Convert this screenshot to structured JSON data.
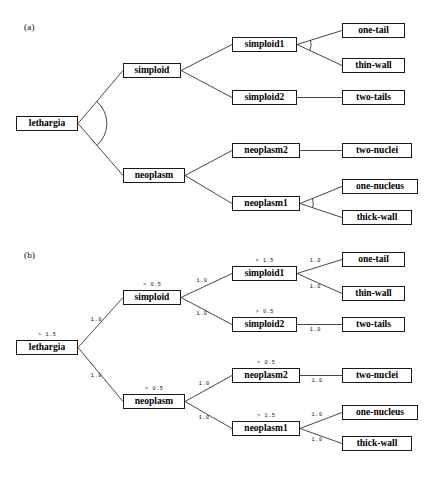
{
  "figure": {
    "panels": [
      {
        "id": "a",
        "label": "(a)",
        "shows_weights": false,
        "nodes": [
          {
            "key": "lethargia",
            "label": "lethargia",
            "x": 16,
            "y": 116,
            "w": 62,
            "type": "internal"
          },
          {
            "key": "simploid",
            "label": "simploid",
            "x": 123,
            "y": 63,
            "w": 58,
            "type": "internal"
          },
          {
            "key": "neoplasm",
            "label": "neoplasm",
            "x": 123,
            "y": 168,
            "w": 62,
            "type": "internal"
          },
          {
            "key": "simploid1",
            "label": "simploid1",
            "x": 232,
            "y": 37,
            "w": 65,
            "type": "internal"
          },
          {
            "key": "simploid2",
            "label": "simploid2",
            "x": 232,
            "y": 90,
            "w": 65,
            "type": "internal"
          },
          {
            "key": "neoplasm2",
            "label": "neoplasm2",
            "x": 232,
            "y": 143,
            "w": 68,
            "type": "internal"
          },
          {
            "key": "neoplasm1",
            "label": "neoplasm1",
            "x": 232,
            "y": 196,
            "w": 68,
            "type": "internal"
          },
          {
            "key": "one-tail",
            "label": "one-tail",
            "x": 342,
            "y": 23,
            "w": 63,
            "type": "leaf"
          },
          {
            "key": "thin-wall",
            "label": "thin-wall",
            "x": 342,
            "y": 58,
            "w": 63,
            "type": "leaf"
          },
          {
            "key": "two-tails",
            "label": "two-tails",
            "x": 342,
            "y": 90,
            "w": 63,
            "type": "leaf"
          },
          {
            "key": "two-nuclei",
            "label": "two-nuclei",
            "x": 342,
            "y": 143,
            "w": 70,
            "type": "leaf"
          },
          {
            "key": "one-nucleus",
            "label": "one-nucleus",
            "x": 342,
            "y": 179,
            "w": 76,
            "type": "leaf"
          },
          {
            "key": "thick-wall",
            "label": "thick-wall",
            "x": 342,
            "y": 210,
            "w": 70,
            "type": "leaf"
          }
        ],
        "edges": [
          {
            "from": "lethargia",
            "to": "simploid"
          },
          {
            "from": "lethargia",
            "to": "neoplasm"
          },
          {
            "from": "simploid",
            "to": "simploid1"
          },
          {
            "from": "simploid",
            "to": "simploid2"
          },
          {
            "from": "simploid1",
            "to": "one-tail"
          },
          {
            "from": "simploid1",
            "to": "thin-wall"
          },
          {
            "from": "simploid2",
            "to": "two-tails"
          },
          {
            "from": "neoplasm",
            "to": "neoplasm2"
          },
          {
            "from": "neoplasm",
            "to": "neoplasm1"
          },
          {
            "from": "neoplasm2",
            "to": "two-nuclei"
          },
          {
            "from": "neoplasm1",
            "to": "one-nucleus"
          },
          {
            "from": "neoplasm1",
            "to": "thick-wall"
          }
        ],
        "arcs": [
          "lethargia",
          "simploid1",
          "neoplasm1"
        ]
      },
      {
        "id": "b",
        "label": "(b)",
        "shows_weights": true,
        "nodes": [
          {
            "key": "lethargia",
            "label": "lethargia",
            "x": 16,
            "y": 96,
            "w": 62,
            "type": "internal",
            "threshold": "> 1.5"
          },
          {
            "key": "simploid",
            "label": "simploid",
            "x": 123,
            "y": 46,
            "w": 58,
            "type": "internal",
            "threshold": "> 0.5"
          },
          {
            "key": "neoplasm",
            "label": "neoplasm",
            "x": 123,
            "y": 150,
            "w": 62,
            "type": "internal",
            "threshold": "> 0.5"
          },
          {
            "key": "simploid1",
            "label": "simploid1",
            "x": 232,
            "y": 22,
            "w": 65,
            "type": "internal",
            "threshold": "> 1.5"
          },
          {
            "key": "simploid2",
            "label": "simploid2",
            "x": 232,
            "y": 73,
            "w": 65,
            "type": "internal",
            "threshold": "> 0.5"
          },
          {
            "key": "neoplasm2",
            "label": "neoplasm2",
            "x": 232,
            "y": 124,
            "w": 68,
            "type": "internal",
            "threshold": "> 0.5"
          },
          {
            "key": "neoplasm1",
            "label": "neoplasm1",
            "x": 232,
            "y": 177,
            "w": 68,
            "type": "internal",
            "threshold": "> 1.5"
          },
          {
            "key": "one-tail",
            "label": "one-tail",
            "x": 342,
            "y": 8,
            "w": 63,
            "type": "leaf"
          },
          {
            "key": "thin-wall",
            "label": "thin-wall",
            "x": 342,
            "y": 42,
            "w": 63,
            "type": "leaf"
          },
          {
            "key": "two-tails",
            "label": "two-tails",
            "x": 342,
            "y": 73,
            "w": 63,
            "type": "leaf"
          },
          {
            "key": "two-nuclei",
            "label": "two-nuclei",
            "x": 342,
            "y": 124,
            "w": 70,
            "type": "leaf"
          },
          {
            "key": "one-nucleus",
            "label": "one-nucleus",
            "x": 342,
            "y": 161,
            "w": 76,
            "type": "leaf"
          },
          {
            "key": "thick-wall",
            "label": "thick-wall",
            "x": 342,
            "y": 192,
            "w": 70,
            "type": "leaf"
          }
        ],
        "edges": [
          {
            "from": "lethargia",
            "to": "simploid",
            "weight": "1.0"
          },
          {
            "from": "lethargia",
            "to": "neoplasm",
            "weight": "1.0"
          },
          {
            "from": "simploid",
            "to": "simploid1",
            "weight": "1.0"
          },
          {
            "from": "simploid",
            "to": "simploid2",
            "weight": "1.0"
          },
          {
            "from": "simploid1",
            "to": "one-tail",
            "weight": "1.0"
          },
          {
            "from": "simploid1",
            "to": "thin-wall",
            "weight": "1.0"
          },
          {
            "from": "simploid2",
            "to": "two-tails",
            "weight": "1.0"
          },
          {
            "from": "neoplasm",
            "to": "neoplasm2",
            "weight": "1.0"
          },
          {
            "from": "neoplasm",
            "to": "neoplasm1",
            "weight": "1.0"
          },
          {
            "from": "neoplasm2",
            "to": "two-nuclei",
            "weight": "1.0"
          },
          {
            "from": "neoplasm1",
            "to": "one-nucleus",
            "weight": "1.0"
          },
          {
            "from": "neoplasm1",
            "to": "thick-wall",
            "weight": "1.0"
          }
        ],
        "arcs": []
      }
    ],
    "colors": {
      "node_border": "#1a1a1a",
      "node_fill": "#ffffff",
      "edge": "#1a1a1a",
      "text": "#000000",
      "background": "#ffffff"
    }
  }
}
